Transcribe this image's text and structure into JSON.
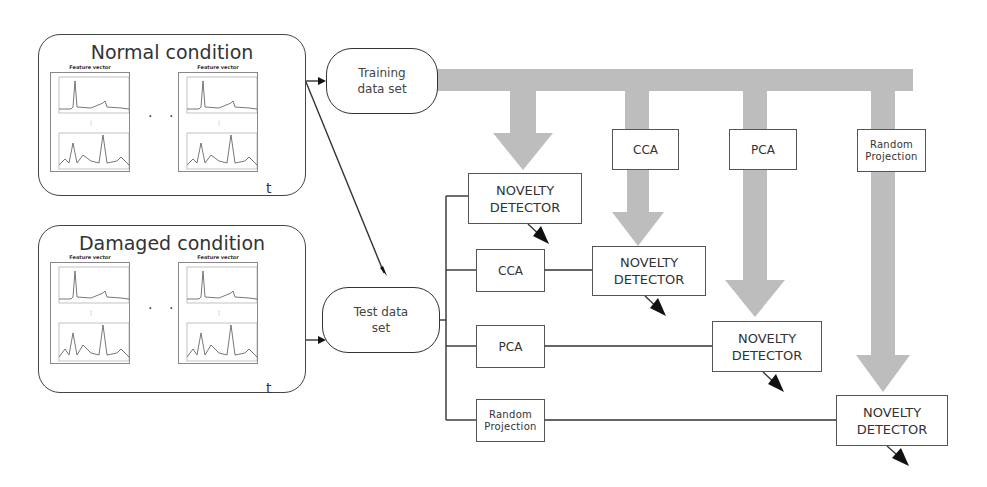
{
  "conditions": [
    {
      "title": "Normal condition",
      "axis_label": "t",
      "panel_title": "Feature vector",
      "ellipsis": "· · ·"
    },
    {
      "title": "Damaged condition",
      "axis_label": "t",
      "panel_title": "Feature vector",
      "ellipsis": "· · ·"
    }
  ],
  "data_sets": {
    "training": "Training data set",
    "test": "Test data set"
  },
  "training_reducers": [
    {
      "label": "CCA"
    },
    {
      "label": "PCA"
    },
    {
      "label": "Random Projection"
    }
  ],
  "test_branches": [
    {
      "reducer": null,
      "detector": "NOVELTY DETECTOR"
    },
    {
      "reducer": "CCA",
      "detector": "NOVELTY DETECTOR"
    },
    {
      "reducer": "PCA",
      "detector": "NOVELTY DETECTOR"
    },
    {
      "reducer": "Random Projection",
      "detector": "NOVELTY DETECTOR"
    }
  ],
  "colors": {
    "flow_arrow": "#bdbdbd",
    "line": "#333333",
    "box_border": "#555555"
  }
}
